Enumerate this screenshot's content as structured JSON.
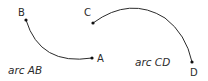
{
  "diagram": {
    "arcs": [
      {
        "id": "AB",
        "caption": "arc AB",
        "start": {
          "label": "A",
          "x": 92,
          "y": 58
        },
        "end": {
          "label": "B",
          "x": 26,
          "y": 20
        }
      },
      {
        "id": "CD",
        "caption": "arc CD",
        "start": {
          "label": "C",
          "x": 93,
          "y": 23
        },
        "end": {
          "label": "D",
          "x": 192,
          "y": 62
        }
      }
    ],
    "colors": {
      "stroke": "#2b2b2b",
      "background": "#ffffff"
    }
  }
}
